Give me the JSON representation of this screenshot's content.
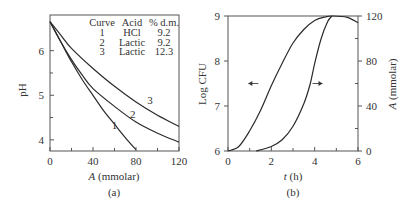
{
  "chart_data": [
    {
      "panel": "(a)",
      "type": "line",
      "title": "",
      "xlabel_var": "A",
      "xlabel_unit": "(mmolar)",
      "ylabel": "pH",
      "xlim": [
        0,
        120
      ],
      "ylim": [
        3.75,
        6.8
      ],
      "xticks": [
        0,
        40,
        80,
        120
      ],
      "xminor": [
        20,
        60,
        100
      ],
      "yticks": [
        4,
        5,
        6
      ],
      "yminor": [
        4.5,
        5.5
      ],
      "grid": false,
      "legend_table": {
        "headers": [
          "Curve",
          "Acid",
          "% d.m."
        ],
        "rows": [
          [
            "1",
            "HCl",
            "9.2"
          ],
          [
            "2",
            "Lactic",
            "9.2"
          ],
          [
            "3",
            "Lactic",
            "12.3"
          ]
        ]
      },
      "series": [
        {
          "name": "1",
          "label_pos": [
            60,
            4.25
          ],
          "x": [
            0,
            10,
            20,
            30,
            40,
            50,
            60,
            70,
            80
          ],
          "y": [
            6.65,
            6.2,
            5.75,
            5.35,
            5.0,
            4.65,
            4.35,
            4.05,
            3.78
          ]
        },
        {
          "name": "2",
          "label_pos": [
            77,
            4.5
          ],
          "x": [
            0,
            10,
            20,
            30,
            40,
            60,
            80,
            100,
            120
          ],
          "y": [
            6.65,
            6.2,
            5.8,
            5.45,
            5.15,
            4.75,
            4.4,
            4.15,
            3.95
          ]
        },
        {
          "name": "3",
          "label_pos": [
            93,
            4.8
          ],
          "x": [
            0,
            10,
            20,
            40,
            60,
            80,
            100,
            120
          ],
          "y": [
            6.65,
            6.35,
            6.05,
            5.6,
            5.2,
            4.85,
            4.55,
            4.3
          ]
        }
      ]
    },
    {
      "panel": "(b)",
      "type": "line",
      "title": "",
      "xlabel_var": "t",
      "xlabel_unit": "(h)",
      "ylabel": "Log CFU",
      "y2label_var": "A",
      "y2label_unit": "(mmolar)",
      "xlim": [
        0,
        6
      ],
      "ylim": [
        6,
        9
      ],
      "y2lim": [
        0,
        120
      ],
      "xticks": [
        0,
        2,
        4,
        6
      ],
      "xminor": [
        1,
        3,
        5
      ],
      "yticks": [
        6,
        7,
        8,
        9
      ],
      "y2ticks": [
        0,
        40,
        80,
        120
      ],
      "y2minor": [
        20,
        60,
        100
      ],
      "grid": false,
      "series": [
        {
          "name": "Log CFU",
          "axis": "left",
          "arrow": "left",
          "arrow_at": [
            1.4,
            7.5
          ],
          "x": [
            0,
            0.5,
            1,
            1.5,
            2,
            2.5,
            3,
            3.5,
            4,
            4.5,
            4.8,
            5.5,
            6
          ],
          "y": [
            6.0,
            6.1,
            6.45,
            6.9,
            7.45,
            7.95,
            8.4,
            8.7,
            8.9,
            8.98,
            9.0,
            8.97,
            8.85
          ]
        },
        {
          "name": "A (mmolar)",
          "axis": "right",
          "arrow": "right",
          "arrow_at": [
            3.9,
            60
          ],
          "x": [
            1.3,
            2,
            2.5,
            3,
            3.5,
            3.8,
            4,
            4.3,
            4.6,
            4.8
          ],
          "y": [
            0,
            4,
            10,
            22,
            42,
            60,
            78,
            100,
            115,
            120
          ]
        }
      ]
    }
  ]
}
